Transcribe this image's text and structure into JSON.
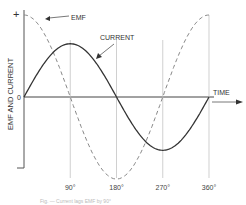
{
  "diagram": {
    "title": "",
    "y_axis": {
      "label": "EMF AND CURRENT",
      "plus_label": "+",
      "minus_label": "–",
      "zero_label": "0"
    },
    "x_axis": {
      "label": "TIME",
      "ticks": [
        "90°",
        "180°",
        "270°",
        "360°"
      ]
    },
    "curves": [
      {
        "name": "EMF",
        "label": "EMF",
        "style": "dashed",
        "function": "cosine",
        "relative_amplitude": 1.0,
        "color": "#888888"
      },
      {
        "name": "CURRENT",
        "label": "CURRENT",
        "style": "solid",
        "function": "sine",
        "relative_amplitude": 0.65,
        "color": "#333333"
      }
    ],
    "caption": "Fig. — Current lags EMF by 90°"
  },
  "chart_data": {
    "type": "line",
    "title": "",
    "xlabel": "TIME",
    "ylabel": "EMF AND CURRENT",
    "x_ticks": [
      "90°",
      "180°",
      "270°",
      "360°"
    ],
    "x": [
      0,
      45,
      90,
      135,
      180,
      225,
      270,
      315,
      360
    ],
    "xlim": [
      0,
      360
    ],
    "ylim": [
      -1,
      1
    ],
    "series": [
      {
        "name": "EMF",
        "values": [
          1,
          0.707,
          0,
          -0.707,
          -1,
          -0.707,
          0,
          0.707,
          1
        ]
      },
      {
        "name": "CURRENT",
        "values": [
          0,
          0.46,
          0.65,
          0.46,
          0,
          -0.46,
          -0.65,
          -0.46,
          0
        ]
      }
    ],
    "grid": false,
    "legend": "annotations"
  }
}
